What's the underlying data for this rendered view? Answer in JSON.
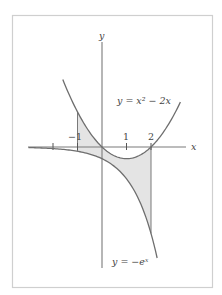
{
  "figure": {
    "axis_labels": {
      "x": "x",
      "y": "y"
    },
    "tick_labels": [
      {
        "value": -1,
        "label": "−1"
      },
      {
        "value": 1,
        "label": "1"
      },
      {
        "value": 2,
        "label": "2"
      }
    ],
    "unlabeled_ticks": [
      -2
    ],
    "curves": [
      {
        "name": "parabola",
        "label": "y = x² − 2x",
        "expression": "x^2 - 2x",
        "x_range": [
          -1.6,
          3.2
        ]
      },
      {
        "name": "negative-exponential",
        "label": "y = −eˣ",
        "expression": "-e^x",
        "x_range": [
          -3.0,
          2.25
        ]
      }
    ],
    "shaded_region": {
      "between": [
        "x^2 - 2x",
        "-e^x"
      ],
      "x_from": -1,
      "x_to": 2,
      "color": "#e4e4e4"
    },
    "colors": {
      "curve": "#6e6e6e",
      "axis": "#7a7a7a",
      "frame": "#cfcfcf",
      "shade": "#e4e4e4"
    }
  },
  "chart_data": {
    "type": "line",
    "title": "",
    "xlabel": "x",
    "ylabel": "y",
    "xticks": [
      -2,
      -1,
      1,
      2
    ],
    "xtick_labels": [
      "",
      "−1",
      "1",
      "2"
    ],
    "series": [
      {
        "name": "y = x² − 2x",
        "function": "x^2 - 2x",
        "x_range": [
          -1.6,
          3.2
        ]
      },
      {
        "name": "y = −eˣ",
        "function": "-e^x",
        "x_range": [
          -3.0,
          2.25
        ]
      }
    ],
    "shaded_area": {
      "x_from": -1,
      "x_to": 2,
      "upper": "x^2 - 2x",
      "lower": "-e^x"
    },
    "grid": false,
    "legend": "inline labels"
  }
}
